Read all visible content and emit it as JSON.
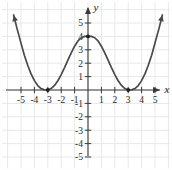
{
  "chart_data": {
    "type": "line",
    "title": "",
    "xlabel": "x",
    "ylabel": "y",
    "xlim": [
      -6.2,
      6.2
    ],
    "ylim": [
      -5.8,
      5.8
    ],
    "grid": true,
    "legend": null,
    "x_ticks": [
      -5,
      -4,
      -3,
      -2,
      -1,
      1,
      2,
      3,
      4,
      5
    ],
    "y_ticks": [
      5,
      4,
      3,
      2,
      1,
      -1,
      -2,
      -3,
      -4,
      -5
    ],
    "x_tick_labels": [
      "-5",
      "-4",
      "-3",
      "-2",
      "-1",
      "1",
      "2",
      "3",
      "4",
      "5"
    ],
    "y_tick_labels": [
      "5",
      "4",
      "3",
      "2",
      "1",
      "-1",
      "-2",
      "-3",
      "-4",
      "-5"
    ],
    "series": [
      {
        "name": "curve",
        "color": "#4a4a4a",
        "arrows": [
          "left-end-up",
          "right-end-up"
        ],
        "x": [
          -5.55,
          -5.3,
          -5.0,
          -4.75,
          -4.5,
          -4.25,
          -4.0,
          -3.75,
          -3.5,
          -3.25,
          -3.0,
          -2.75,
          -2.5,
          -2.25,
          -2.0,
          -1.75,
          -1.5,
          -1.25,
          -1.0,
          -0.75,
          -0.5,
          -0.25,
          0.0,
          0.25,
          0.5,
          0.75,
          1.0,
          1.25,
          1.5,
          1.75,
          2.0,
          2.25,
          2.5,
          2.75,
          3.0,
          3.25,
          3.5,
          3.75,
          4.0,
          4.25,
          4.5,
          4.75,
          5.0,
          5.3,
          5.55
        ],
        "y": [
          5.6,
          4.6,
          3.5,
          2.6,
          1.85,
          1.2,
          0.7,
          0.33,
          0.1,
          0.01,
          0.0,
          0.11,
          0.34,
          0.69,
          1.15,
          1.67,
          2.23,
          2.77,
          3.27,
          3.66,
          3.9,
          4.0,
          4.0,
          4.0,
          3.9,
          3.66,
          3.27,
          2.77,
          2.23,
          1.67,
          1.15,
          0.69,
          0.34,
          0.11,
          0.0,
          0.01,
          0.1,
          0.33,
          0.7,
          1.2,
          1.85,
          2.6,
          3.5,
          4.6,
          5.6
        ]
      }
    ],
    "marked_points": [
      {
        "label": "(-3, 0)",
        "x": -3,
        "y": 0
      },
      {
        "label": "(0, 4)",
        "x": 0,
        "y": 4
      },
      {
        "label": "(3, 0)",
        "x": 3,
        "y": 0
      }
    ],
    "colors": {
      "curve": "#4a4a4a",
      "axis": "#3a3a3a",
      "grid": "#e8e8e8",
      "text": "#2a2a2a",
      "background": "#ffffff"
    }
  },
  "axes": {
    "x_label": "x",
    "y_label": "y"
  }
}
